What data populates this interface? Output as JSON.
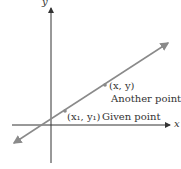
{
  "diagram": {
    "axes": {
      "x_label": "x",
      "y_label": "y"
    },
    "points": [
      {
        "label_coord": "(x, y)",
        "label_text": "Another point"
      },
      {
        "label_coord": "(x₁, y₁)",
        "label_text": "Given point"
      }
    ],
    "colors": {
      "line": "#8a8a8a",
      "point": "#8a8a8a",
      "axis": "#333333",
      "text": "#333333"
    }
  }
}
